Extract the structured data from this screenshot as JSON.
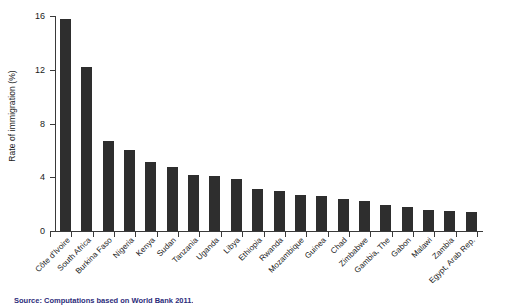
{
  "chart_data": {
    "type": "bar",
    "title": "",
    "xlabel": "",
    "ylabel": "Rate of immigration (%)",
    "ylim": [
      0,
      16
    ],
    "yticks": [
      0,
      4,
      8,
      12,
      16
    ],
    "grid": false,
    "legend": null,
    "bar_color": "#2e2e2e",
    "categories": [
      "Côte d'Ivoire",
      "South Africa",
      "Burkina Faso",
      "Nigeria",
      "Kenya",
      "Sudan",
      "Tanzania",
      "Uganda",
      "Libya",
      "Ethiopia",
      "Rwanda",
      "Mozambique",
      "Guinea",
      "Chad",
      "Zimbabwe",
      "Gambia, The",
      "Gabon",
      "Malawi",
      "Zambia",
      "Egypt, Arab Rep."
    ],
    "values": [
      15.8,
      12.2,
      6.7,
      6.0,
      5.1,
      4.8,
      4.2,
      4.1,
      3.9,
      3.1,
      3.0,
      2.7,
      2.6,
      2.4,
      2.2,
      1.9,
      1.8,
      1.6,
      1.5,
      1.4
    ]
  },
  "source": {
    "text": "Source: Computations based on World Bank 2011."
  }
}
